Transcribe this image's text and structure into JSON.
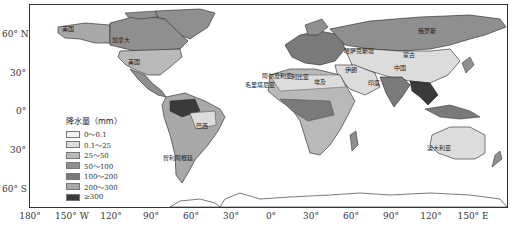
{
  "map": {
    "title": "",
    "legend": {
      "title": "降水量（mm）",
      "items": [
        {
          "label": "0～0.1",
          "color": "#f2f2f2"
        },
        {
          "label": "0.1～25",
          "color": "#dcdcdc"
        },
        {
          "label": "25～50",
          "color": "#b9b9b9"
        },
        {
          "label": "50～100",
          "color": "#8f8f8f"
        },
        {
          "label": "100～200",
          "color": "#7a7a7a"
        },
        {
          "label": "200～300",
          "color": "#a8a8a8"
        },
        {
          "label": "≥300",
          "color": "#3a3a3a"
        }
      ]
    },
    "y_axis": [
      "60° N",
      "30°",
      "0°",
      "30°",
      "60° S"
    ],
    "x_axis": [
      "180°",
      "150° W",
      "120°",
      "90°",
      "60°",
      "30°",
      "0°",
      "30°",
      "60°",
      "90°",
      "120°",
      "150° E"
    ],
    "country_labels": [
      {
        "name": "美国",
        "x": 62,
        "y": 27
      },
      {
        "name": "加拿大",
        "x": 112,
        "y": 37
      },
      {
        "name": "美国",
        "x": 128,
        "y": 60
      },
      {
        "name": "巴西",
        "x": 196,
        "y": 124
      },
      {
        "name": "智利阿根廷",
        "x": 163,
        "y": 156
      },
      {
        "name": "毛里塔尼亚",
        "x": 247,
        "y": 82
      },
      {
        "name": "阿尔及利亚",
        "x": 262,
        "y": 74
      },
      {
        "name": "利比亚",
        "x": 291,
        "y": 75
      },
      {
        "name": "埃及",
        "x": 314,
        "y": 79
      },
      {
        "name": "伊朗",
        "x": 348,
        "y": 67
      },
      {
        "name": "哈萨克斯坦",
        "x": 348,
        "y": 48
      },
      {
        "name": "俄罗斯",
        "x": 418,
        "y": 28
      },
      {
        "name": "蒙古",
        "x": 405,
        "y": 52
      },
      {
        "name": "中国",
        "x": 395,
        "y": 65
      },
      {
        "name": "印度",
        "x": 369,
        "y": 80
      },
      {
        "name": "澳大利亚",
        "x": 431,
        "y": 145
      }
    ]
  }
}
